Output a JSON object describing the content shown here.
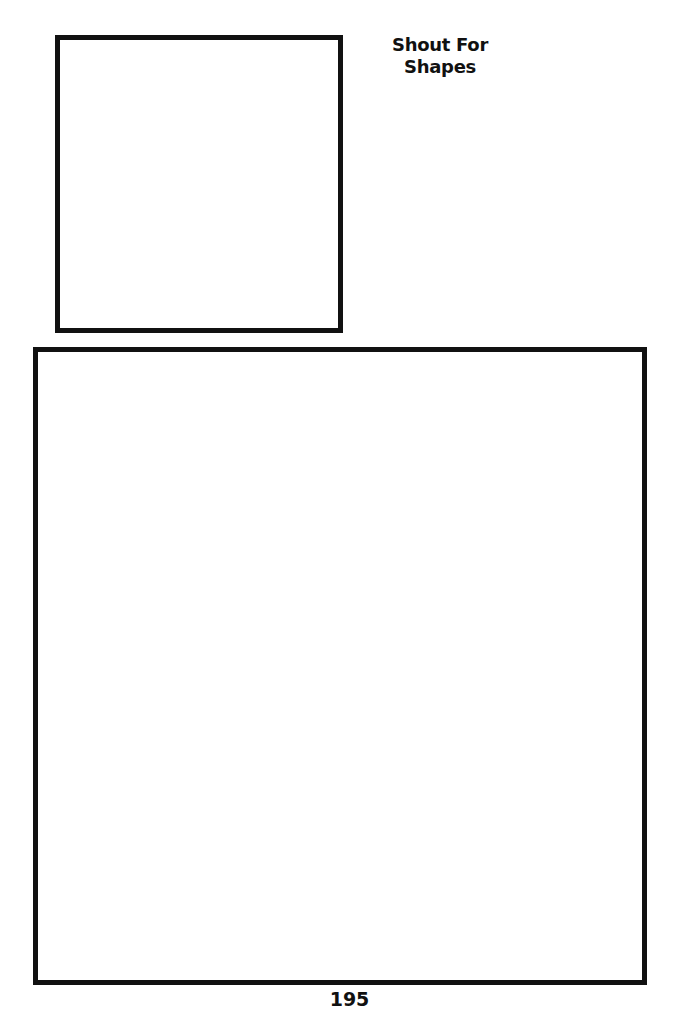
{
  "worksheet": {
    "title_line1": "Shout For",
    "title_line2": "Shapes",
    "page_number": "195",
    "drawing_boxes": [
      {
        "name": "small-drawing-box",
        "content": ""
      },
      {
        "name": "large-drawing-box",
        "content": ""
      }
    ],
    "colors": {
      "line": "#111111",
      "background": "#ffffff"
    }
  }
}
